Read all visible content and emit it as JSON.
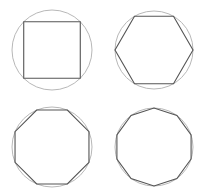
{
  "diagram": {
    "title": "",
    "colors": {
      "circle": "#b8b8b8",
      "polygon": "#555555",
      "background": "#ffffff"
    },
    "panels": [
      {
        "name": "square",
        "sides": 4,
        "cx": 52,
        "cy": 50,
        "r": 40,
        "rotation_deg": 45
      },
      {
        "name": "hexagon",
        "sides": 6,
        "cx": 154,
        "cy": 50,
        "r": 39,
        "rotation_deg": 0
      },
      {
        "name": "octagon",
        "sides": 8,
        "cx": 52,
        "cy": 147,
        "r": 40,
        "rotation_deg": 22.5
      },
      {
        "name": "decagon",
        "sides": 10,
        "cx": 154,
        "cy": 147,
        "r": 39,
        "rotation_deg": 18
      }
    ]
  }
}
